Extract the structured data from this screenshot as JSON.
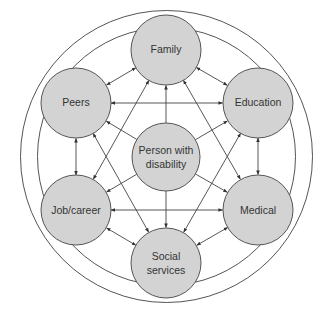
{
  "diagram": {
    "type": "concentric-network",
    "center_node": {
      "id": "person",
      "label_lines": [
        "Person with",
        "disability"
      ]
    },
    "outer_nodes": [
      {
        "id": "family",
        "label_lines": [
          "Family"
        ]
      },
      {
        "id": "education",
        "label_lines": [
          "Education"
        ]
      },
      {
        "id": "medical",
        "label_lines": [
          "Medical"
        ]
      },
      {
        "id": "social",
        "label_lines": [
          "Social",
          "services"
        ]
      },
      {
        "id": "job",
        "label_lines": [
          "Job/career"
        ]
      },
      {
        "id": "peers",
        "label_lines": [
          "Peers"
        ]
      }
    ],
    "edges": [
      {
        "from": "person",
        "to": "family",
        "direction": "one-way"
      },
      {
        "from": "person",
        "to": "education",
        "direction": "one-way"
      },
      {
        "from": "person",
        "to": "medical",
        "direction": "one-way"
      },
      {
        "from": "person",
        "to": "social",
        "direction": "one-way"
      },
      {
        "from": "person",
        "to": "job",
        "direction": "one-way"
      },
      {
        "from": "person",
        "to": "peers",
        "direction": "one-way"
      },
      {
        "from": "family",
        "to": "peers",
        "direction": "two-way"
      },
      {
        "from": "family",
        "to": "education",
        "direction": "two-way"
      },
      {
        "from": "education",
        "to": "medical",
        "direction": "two-way"
      },
      {
        "from": "medical",
        "to": "social",
        "direction": "two-way"
      },
      {
        "from": "social",
        "to": "job",
        "direction": "two-way"
      },
      {
        "from": "job",
        "to": "peers",
        "direction": "two-way"
      },
      {
        "from": "peers",
        "to": "education",
        "direction": "two-way"
      },
      {
        "from": "job",
        "to": "medical",
        "direction": "two-way"
      },
      {
        "from": "family",
        "to": "job",
        "direction": "two-way"
      },
      {
        "from": "family",
        "to": "medical",
        "direction": "two-way"
      },
      {
        "from": "peers",
        "to": "social",
        "direction": "two-way"
      },
      {
        "from": "education",
        "to": "social",
        "direction": "two-way"
      }
    ],
    "rings": 2,
    "colors": {
      "node_fill": "#d3d3d3",
      "stroke": "#555555",
      "text": "#333333"
    }
  }
}
